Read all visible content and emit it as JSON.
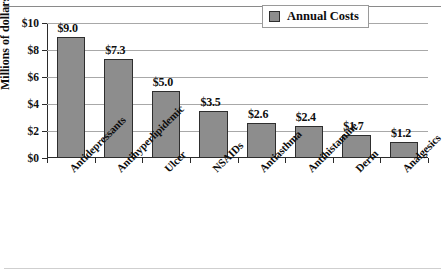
{
  "chart_data": {
    "type": "bar",
    "title": "",
    "xlabel": "",
    "ylabel": "Millions of dollars",
    "ylim": [
      0,
      10
    ],
    "ytick_labels": [
      "$0",
      "$2",
      "$4",
      "$6",
      "$8",
      "$10"
    ],
    "ytick_values": [
      0,
      2,
      4,
      6,
      8,
      10
    ],
    "grid": true,
    "legend_position": "top-right",
    "categories": [
      "Antidepressants",
      "Antihyperlipidemic",
      "Ulcer",
      "NSAIDs",
      "Antiasthma",
      "Antihistamine",
      "Derm",
      "Analgesics"
    ],
    "series": [
      {
        "name": "Annual Costs",
        "values": [
          9.0,
          7.3,
          5.0,
          3.5,
          2.6,
          2.4,
          1.7,
          1.2
        ],
        "color": "#8d8d8d"
      }
    ],
    "data_labels": [
      "$9.0",
      "$7.3",
      "$5.0",
      "$3.5",
      "$2.6",
      "$2.4",
      "$1.7",
      "$1.2"
    ]
  },
  "legend": {
    "entries": [
      {
        "label": "Annual Costs",
        "color": "#8d8d8d"
      }
    ]
  }
}
